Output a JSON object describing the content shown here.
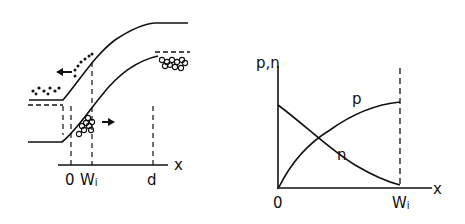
{
  "left_diagram": {
    "description": "Energy band diagram with electrons and holes",
    "x_axis_label": "x",
    "ticks": [
      {
        "label": "0",
        "sub": ""
      },
      {
        "label": "W",
        "sub": "i"
      },
      {
        "label": "d",
        "sub": ""
      }
    ],
    "carriers": {
      "electrons": "dots (drifting left)",
      "holes": "circles (drifting right)"
    }
  },
  "right_diagram": {
    "y_axis_label": "p,n",
    "x_axis_label": "x",
    "origin_label": "0",
    "end_label": {
      "main": "W",
      "sub": "i"
    },
    "curves": [
      {
        "name": "p",
        "label": "p",
        "trend": "increasing from 0 to W_i"
      },
      {
        "name": "n",
        "label": "n",
        "trend": "decreasing from 0 to W_i"
      }
    ]
  },
  "colors": {
    "ink": "#111111",
    "background": "#ffffff"
  }
}
